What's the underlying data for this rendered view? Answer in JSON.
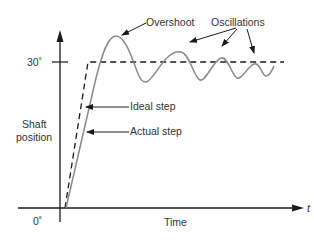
{
  "diagram": {
    "type": "step-response",
    "labels": {
      "overshoot": "Overshoot",
      "oscillations": "Oscillations",
      "ideal_step": "Ideal step",
      "actual_step": "Actual step",
      "y_axis_line1": "Shaft",
      "y_axis_line2": "position",
      "x_axis": "Time",
      "t_symbol": "t",
      "y_tick_top": "30˚",
      "y_tick_zero": "0˚"
    },
    "colors": {
      "axis": "#1a1a1a",
      "ideal_step": "#1a1a1a",
      "actual_curve": "#8a8a8a",
      "text": "#333333"
    }
  }
}
